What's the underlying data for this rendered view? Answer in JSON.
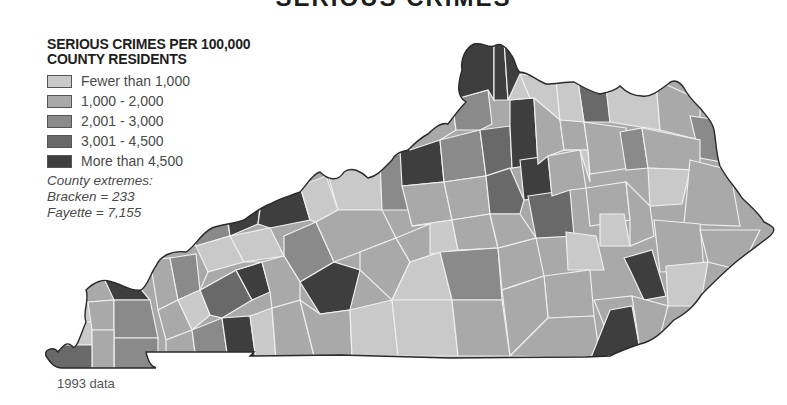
{
  "header": {
    "title": "SERIOUS CRIMES"
  },
  "legend": {
    "title_line1": "SERIOUS CRIMES PER 100,000",
    "title_line2": "COUNTY RESIDENTS",
    "items": [
      {
        "label": "Fewer than 1,000",
        "color": "#c9c9c9"
      },
      {
        "label": "1,000 - 2,000",
        "color": "#a9a9a9"
      },
      {
        "label": "2,001 - 3,000",
        "color": "#8a8a8a"
      },
      {
        "label": "3,001 - 4,500",
        "color": "#696969"
      },
      {
        "label": "More than 4,500",
        "color": "#3e3e3e"
      }
    ],
    "extremes_heading": "County extremes:",
    "extremes": [
      {
        "text": "Bracken = 233"
      },
      {
        "text": "Fayette = 7,155"
      }
    ]
  },
  "footnote": "1993 data",
  "map": {
    "region": "Kentucky",
    "unit": "serious crimes per 100,000 county residents",
    "year": "1993"
  }
}
